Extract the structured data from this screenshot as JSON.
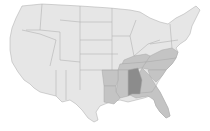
{
  "map": {
    "title": "United States",
    "highlighted_state": "Alabama",
    "colors": {
      "base": "#e6e6e6",
      "region": "#c4c4c4",
      "highlight": "#8c8c8c",
      "border": "#a8a8a8"
    },
    "region_states": [
      "Arkansas",
      "Louisiana",
      "Mississippi",
      "Tennessee",
      "Kentucky",
      "Georgia",
      "Florida",
      "South Carolina",
      "North Carolina",
      "Virginia"
    ]
  }
}
